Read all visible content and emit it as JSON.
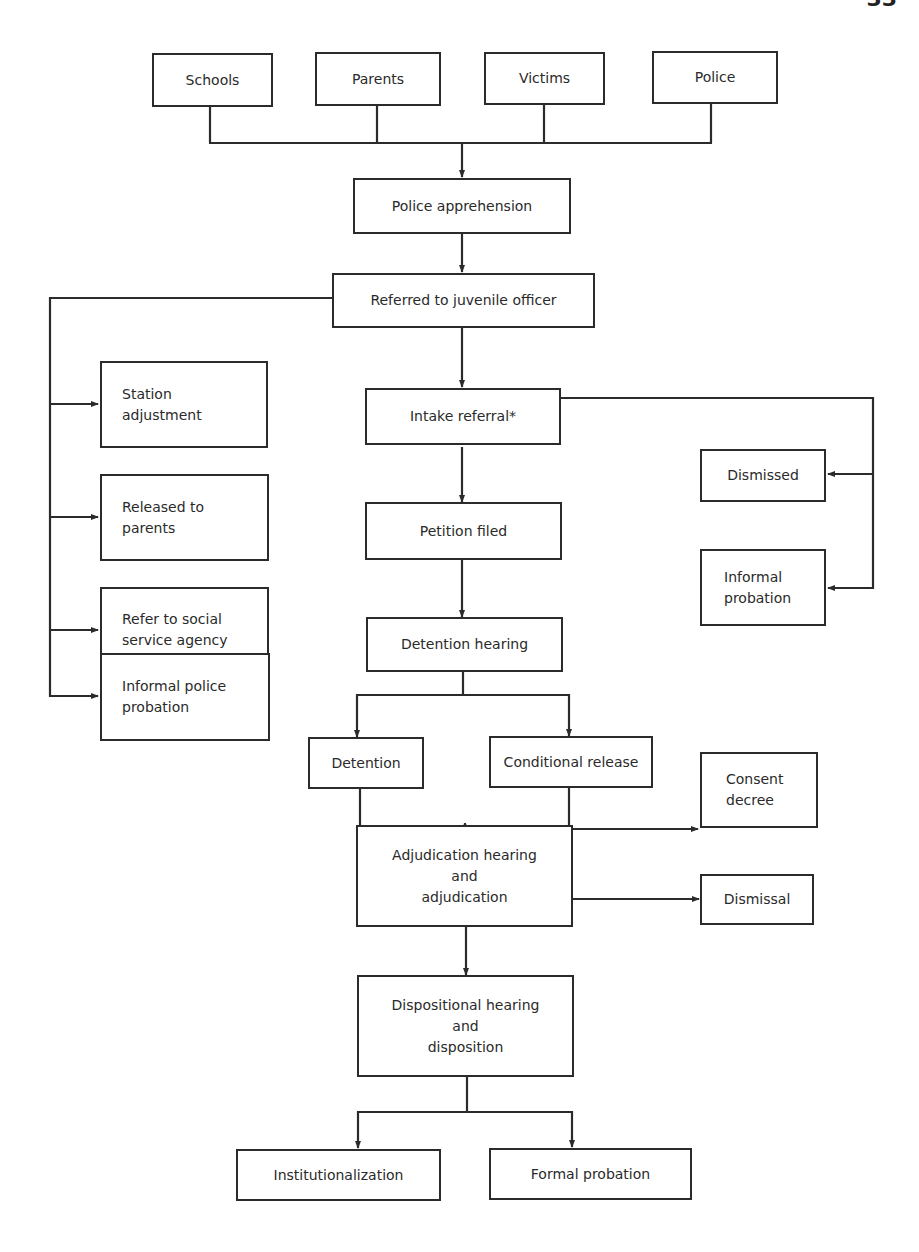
{
  "page": {
    "number_partial": "33"
  },
  "diagram": {
    "sources": [
      "Schools",
      "Parents",
      "Victims",
      "Police"
    ],
    "nodes": {
      "police_apprehension": "Police apprehension",
      "referred_juvenile_officer": "Referred to juvenile officer",
      "station_adjustment": "Station\nadjustment",
      "released_to_parents": "Released to\nparents",
      "refer_social_service": "Refer to social\nservice agency",
      "informal_police_probation": "Informal police\nprobation",
      "intake_referral": "Intake referral*",
      "dismissed": "Dismissed",
      "informal_probation": "Informal\nprobation",
      "petition_filed": "Petition filed",
      "detention_hearing": "Detention hearing",
      "detention": "Detention",
      "conditional_release": "Conditional release",
      "consent_decree": "Consent\ndecree",
      "adjudication": "Adjudication hearing\nand\nadjudication",
      "dismissal": "Dismissal",
      "dispositional": "Dispositional hearing\nand\ndisposition",
      "institutionalization": "Institutionalization",
      "formal_probation": "Formal probation"
    },
    "edges": [
      [
        "Schools",
        "Police apprehension"
      ],
      [
        "Parents",
        "Police apprehension"
      ],
      [
        "Victims",
        "Police apprehension"
      ],
      [
        "Police",
        "Police apprehension"
      ],
      [
        "Police apprehension",
        "Referred to juvenile officer"
      ],
      [
        "Referred to juvenile officer",
        "Station adjustment"
      ],
      [
        "Referred to juvenile officer",
        "Released to parents"
      ],
      [
        "Referred to juvenile officer",
        "Refer to social service agency"
      ],
      [
        "Referred to juvenile officer",
        "Informal police probation"
      ],
      [
        "Referred to juvenile officer",
        "Intake referral*"
      ],
      [
        "Intake referral*",
        "Dismissed"
      ],
      [
        "Intake referral*",
        "Informal probation"
      ],
      [
        "Intake referral*",
        "Petition filed"
      ],
      [
        "Petition filed",
        "Detention hearing"
      ],
      [
        "Detention hearing",
        "Detention"
      ],
      [
        "Detention hearing",
        "Conditional release"
      ],
      [
        "Detention",
        "Adjudication hearing and adjudication"
      ],
      [
        "Conditional release",
        "Adjudication hearing and adjudication"
      ],
      [
        "Detention / Conditional release",
        "Consent decree"
      ],
      [
        "Adjudication hearing and adjudication",
        "Dismissal"
      ],
      [
        "Adjudication hearing and adjudication",
        "Dispositional hearing and disposition"
      ],
      [
        "Dispositional hearing and disposition",
        "Institutionalization"
      ],
      [
        "Dispositional hearing and disposition",
        "Formal probation"
      ]
    ]
  }
}
